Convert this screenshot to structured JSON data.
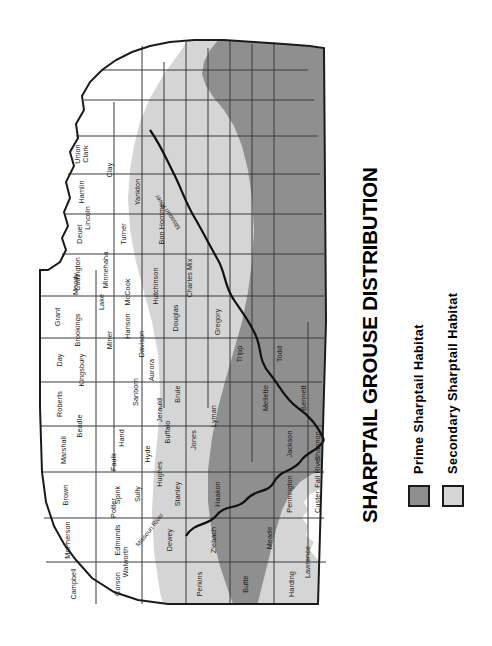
{
  "title": "SHARPTAIL GROUSE DISTRIBUTION",
  "colors": {
    "prime_habitat": "#8f8f8f",
    "secondary_habitat": "#d5d5d5",
    "no_habitat": "#ffffff",
    "outline": "#1b1b1b",
    "county_line": "#3a3a3a",
    "text": "#000000"
  },
  "legend": {
    "items": [
      {
        "label": "Prime Sharptail Habitat",
        "swatch": "#8f8f8f"
      },
      {
        "label": "Secondary Sharptail Habitat",
        "swatch": "#d5d5d5"
      }
    ]
  },
  "map": {
    "rivers": [
      {
        "name": "Missouri River"
      },
      {
        "name": "Missouri River"
      }
    ],
    "counties": [
      {
        "name": "Harding",
        "habitat": "secondary"
      },
      {
        "name": "Butte",
        "habitat": "secondary"
      },
      {
        "name": "Perkins",
        "habitat": "secondary"
      },
      {
        "name": "Corson",
        "habitat": "prime"
      },
      {
        "name": "Campbell",
        "habitat": "prime"
      },
      {
        "name": "McPherson",
        "habitat": "secondary"
      },
      {
        "name": "Brown",
        "habitat": "secondary"
      },
      {
        "name": "Marshall",
        "habitat": "none"
      },
      {
        "name": "Roberts",
        "habitat": "none"
      },
      {
        "name": "Day",
        "habitat": "none"
      },
      {
        "name": "Grant",
        "habitat": "none"
      },
      {
        "name": "Codington",
        "habitat": "none"
      },
      {
        "name": "Deuel",
        "habitat": "none"
      },
      {
        "name": "Hamlin",
        "habitat": "none"
      },
      {
        "name": "Clark",
        "habitat": "none"
      },
      {
        "name": "Spink",
        "habitat": "secondary"
      },
      {
        "name": "Edmunds",
        "habitat": "secondary"
      },
      {
        "name": "Walworth",
        "habitat": "prime"
      },
      {
        "name": "Dewey",
        "habitat": "prime"
      },
      {
        "name": "Ziebach",
        "habitat": "prime"
      },
      {
        "name": "Meade",
        "habitat": "secondary"
      },
      {
        "name": "Lawrence",
        "habitat": "none"
      },
      {
        "name": "Pennington",
        "habitat": "secondary"
      },
      {
        "name": "Haakon",
        "habitat": "prime"
      },
      {
        "name": "Stanley",
        "habitat": "prime"
      },
      {
        "name": "Sully",
        "habitat": "prime"
      },
      {
        "name": "Potter",
        "habitat": "prime"
      },
      {
        "name": "Faulk",
        "habitat": "secondary"
      },
      {
        "name": "Hand",
        "habitat": "secondary"
      },
      {
        "name": "Beadle",
        "habitat": "secondary"
      },
      {
        "name": "Kingsbury",
        "habitat": "none"
      },
      {
        "name": "Brookings",
        "habitat": "none"
      },
      {
        "name": "Moody",
        "habitat": "none"
      },
      {
        "name": "Lake",
        "habitat": "none"
      },
      {
        "name": "Miner",
        "habitat": "none"
      },
      {
        "name": "Sanborn",
        "habitat": "secondary"
      },
      {
        "name": "Jerauld",
        "habitat": "secondary"
      },
      {
        "name": "Hyde",
        "habitat": "secondary"
      },
      {
        "name": "Hughes",
        "habitat": "prime"
      },
      {
        "name": "Buffalo",
        "habitat": "secondary"
      },
      {
        "name": "Brule",
        "habitat": "secondary"
      },
      {
        "name": "Aurora",
        "habitat": "secondary"
      },
      {
        "name": "Davison",
        "habitat": "secondary"
      },
      {
        "name": "Hanson",
        "habitat": "secondary"
      },
      {
        "name": "McCook",
        "habitat": "none"
      },
      {
        "name": "Minnehaha",
        "habitat": "none"
      },
      {
        "name": "Lincoln",
        "habitat": "none"
      },
      {
        "name": "Turner",
        "habitat": "none"
      },
      {
        "name": "Hutchinson",
        "habitat": "secondary"
      },
      {
        "name": "Douglas",
        "habitat": "secondary"
      },
      {
        "name": "Charles Mix",
        "habitat": "prime"
      },
      {
        "name": "Bon Homme",
        "habitat": "secondary"
      },
      {
        "name": "Yankton",
        "habitat": "none"
      },
      {
        "name": "Clay",
        "habitat": "none"
      },
      {
        "name": "Union",
        "habitat": "none"
      },
      {
        "name": "Gregory",
        "habitat": "prime"
      },
      {
        "name": "Tripp",
        "habitat": "prime"
      },
      {
        "name": "Lyman",
        "habitat": "prime"
      },
      {
        "name": "Jones",
        "habitat": "prime"
      },
      {
        "name": "Mellette",
        "habitat": "prime"
      },
      {
        "name": "Todd",
        "habitat": "prime"
      },
      {
        "name": "Bennett",
        "habitat": "prime"
      },
      {
        "name": "Jackson",
        "habitat": "prime"
      },
      {
        "name": "Shannon",
        "habitat": "secondary"
      },
      {
        "name": "Custer",
        "habitat": "secondary"
      },
      {
        "name": "Fall River",
        "habitat": "secondary"
      }
    ]
  }
}
